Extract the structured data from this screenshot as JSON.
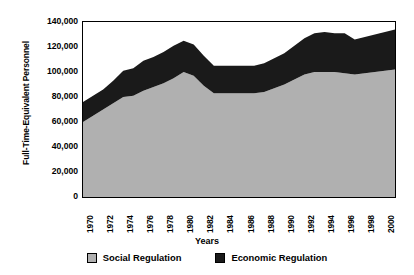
{
  "chart_data": {
    "type": "area",
    "stacked": true,
    "title": "",
    "xlabel": "Years",
    "ylabel": "Full-Time-Equivalent Personnel",
    "ylim": [
      0,
      140000
    ],
    "yticks": [
      0,
      20000,
      40000,
      60000,
      80000,
      100000,
      120000,
      140000
    ],
    "ytick_labels": [
      "0",
      "20,000",
      "40,000",
      "60,000",
      "80,000",
      "100,000",
      "120,000",
      "140,000"
    ],
    "grid": false,
    "legend_position": "bottom",
    "x": [
      1970,
      1971,
      1972,
      1973,
      1974,
      1975,
      1976,
      1977,
      1978,
      1979,
      1980,
      1981,
      1982,
      1983,
      1984,
      1985,
      1986,
      1987,
      1988,
      1989,
      1990,
      1991,
      1992,
      1993,
      1994,
      1995,
      1996,
      1997,
      1998,
      1999,
      2000,
      2001
    ],
    "xtick_labels": [
      "1970",
      "1972",
      "1974",
      "1976",
      "1978",
      "1980",
      "1982",
      "1984",
      "1986",
      "1988",
      "1990",
      "1992",
      "1994",
      "1996",
      "1998",
      "2000"
    ],
    "xtick_years": [
      1970,
      1972,
      1974,
      1976,
      1978,
      1980,
      1982,
      1984,
      1986,
      1988,
      1990,
      1992,
      1994,
      1996,
      1998,
      2000
    ],
    "series": [
      {
        "name": "Social Regulation",
        "color": "#b0b0b0",
        "values": [
          60000,
          65000,
          70000,
          75000,
          80000,
          81000,
          85000,
          88000,
          91000,
          95000,
          100000,
          97000,
          89000,
          83000,
          83000,
          83000,
          83000,
          83000,
          84000,
          87000,
          90000,
          94000,
          98000,
          100000,
          100000,
          100000,
          99000,
          98000,
          99000,
          100000,
          101000,
          102000
        ]
      },
      {
        "name": "Economic Regulation",
        "color": "#1a1a1a",
        "values": [
          16000,
          16000,
          16000,
          18000,
          21000,
          22000,
          24000,
          24000,
          25000,
          26000,
          25000,
          25000,
          24000,
          22000,
          22000,
          22000,
          22000,
          22000,
          23000,
          24000,
          25000,
          27000,
          29000,
          31000,
          32000,
          31000,
          32000,
          28000,
          29000,
          30000,
          31000,
          32000
        ]
      }
    ],
    "totals": [
      76000,
      81000,
      86000,
      93000,
      101000,
      103000,
      109000,
      112000,
      116000,
      121000,
      125000,
      122000,
      113000,
      105000,
      105000,
      105000,
      105000,
      105000,
      107000,
      111000,
      115000,
      121000,
      127000,
      131000,
      132000,
      131000,
      131000,
      126000,
      128000,
      130000,
      132000,
      134000
    ]
  },
  "legend": {
    "items": [
      {
        "label": "Social Regulation",
        "color": "#b0b0b0"
      },
      {
        "label": "Economic Regulation",
        "color": "#1a1a1a"
      }
    ]
  },
  "axes": {
    "y_title": "Full-Time-Equivalent Personnel",
    "x_title": "Years"
  }
}
